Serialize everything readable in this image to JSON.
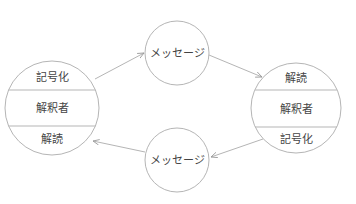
{
  "diagram": {
    "type": "communication-model",
    "colors": {
      "stroke": "#b5b5b5",
      "text": "#444444",
      "background": "#ffffff"
    },
    "nodes": {
      "left_interpreter": {
        "sections": {
          "top": "記号化",
          "middle": "解釈者",
          "bottom": "解読"
        }
      },
      "right_interpreter": {
        "sections": {
          "top": "解読",
          "middle": "解釈者",
          "bottom": "記号化"
        }
      },
      "top_message": {
        "label": "メッセージ"
      },
      "bottom_message": {
        "label": "メッセージ"
      }
    },
    "edges": [
      {
        "from": "left_interpreter",
        "to": "top_message"
      },
      {
        "from": "top_message",
        "to": "right_interpreter"
      },
      {
        "from": "right_interpreter",
        "to": "bottom_message"
      },
      {
        "from": "bottom_message",
        "to": "left_interpreter"
      }
    ]
  }
}
